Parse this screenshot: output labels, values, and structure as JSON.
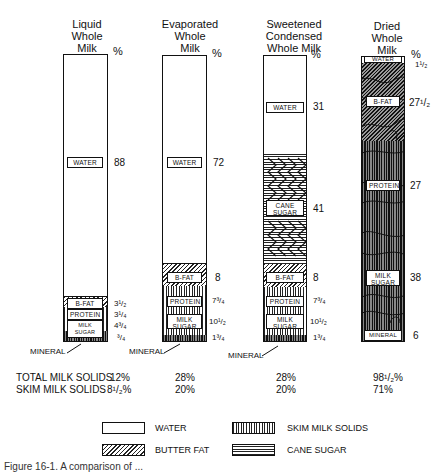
{
  "columns": [
    {
      "title": [
        "Liquid",
        "Whole",
        "Milk"
      ],
      "percent_header": "%",
      "segments": [
        {
          "component": "WATER",
          "label": "WATER",
          "value": "88",
          "pattern": "water"
        },
        {
          "component": "B-FAT",
          "label": "B-FAT",
          "value": "3¹/₂",
          "pattern": "butter-fat"
        },
        {
          "component": "PROTEIN",
          "label": "PROTEIN",
          "value": "3¹/₄",
          "pattern": "skim-milk-solids"
        },
        {
          "component": "MILK SUGAR",
          "label": "MILK SUGAR",
          "value": "4³/₄",
          "pattern": "skim-milk-solids"
        },
        {
          "component": "MINERAL",
          "label": "",
          "value": "³/₄",
          "pattern": "skim-milk-solids"
        }
      ],
      "mineral_pointer": "MINERAL",
      "total_milk_solids": "12%",
      "skim_milk_solids": "8¹/₂%"
    },
    {
      "title": [
        "Evaporated",
        "Whole",
        "Milk"
      ],
      "percent_header": "%",
      "segments": [
        {
          "component": "WATER",
          "label": "WATER",
          "value": "72",
          "pattern": "water"
        },
        {
          "component": "B-FAT",
          "label": "B-FAT",
          "value": "8",
          "pattern": "butter-fat"
        },
        {
          "component": "PROTEIN",
          "label": "PROTEIN",
          "value": "7³/₄",
          "pattern": "skim-milk-solids"
        },
        {
          "component": "MILK SUGAR",
          "label": "MILK SUGAR",
          "value": "10¹/₂",
          "pattern": "skim-milk-solids"
        },
        {
          "component": "MINERAL",
          "label": "",
          "value": "1³/₄",
          "pattern": "skim-milk-solids"
        }
      ],
      "mineral_pointer": "MINERAL",
      "total_milk_solids": "28%",
      "skim_milk_solids": "20%"
    },
    {
      "title": [
        "Sweetened",
        "Condensed",
        "Whole Milk"
      ],
      "percent_header": "%",
      "segments": [
        {
          "component": "WATER",
          "label": "WATER",
          "value": "31",
          "pattern": "water"
        },
        {
          "component": "CANE SUGAR",
          "label": "CANE SUGAR",
          "value": "41",
          "pattern": "cane-sugar"
        },
        {
          "component": "B-FAT",
          "label": "B-FAT",
          "value": "8",
          "pattern": "butter-fat"
        },
        {
          "component": "PROTEIN",
          "label": "PROTEIN",
          "value": "7³/₄",
          "pattern": "skim-milk-solids"
        },
        {
          "component": "MILK SUGAR",
          "label": "MILK SUGAR",
          "value": "10¹/₂",
          "pattern": "skim-milk-solids"
        },
        {
          "component": "MINERAL",
          "label": "",
          "value": "1³/₄",
          "pattern": "skim-milk-solids"
        }
      ],
      "mineral_pointer": "MINERAL",
      "total_milk_solids": "28%",
      "skim_milk_solids": "20%"
    },
    {
      "title": [
        "Dried",
        "Whole",
        "Milk"
      ],
      "percent_header": "%",
      "segments": [
        {
          "component": "WATER",
          "label": "WATER",
          "value": "1¹/₂",
          "pattern": "water"
        },
        {
          "component": "B-FAT",
          "label": "B-FAT",
          "value": "27¹/₂",
          "pattern": "butter-fat"
        },
        {
          "component": "PROTEIN",
          "label": "PROTEIN",
          "value": "27",
          "pattern": "skim-milk-solids"
        },
        {
          "component": "MILK SUGAR",
          "label": "MILK SUGAR",
          "value": "38",
          "pattern": "skim-milk-solids"
        },
        {
          "component": "MINERAL",
          "label": "MINERAL",
          "value": "6",
          "pattern": "skim-milk-solids"
        }
      ],
      "total_milk_solids": "98¹/₂%",
      "skim_milk_solids": "71%"
    }
  ],
  "summary_labels": {
    "total_milk_solids": "TOTAL MILK SOLIDS",
    "skim_milk_solids": "SKIM MILK SOLIDS"
  },
  "legend": [
    {
      "label": "WATER",
      "pattern": "water"
    },
    {
      "label": "SKIM MILK SOLIDS",
      "pattern": "skim-milk-solids"
    },
    {
      "label": "BUTTER FAT",
      "pattern": "butter-fat"
    },
    {
      "label": "CANE SUGAR",
      "pattern": "cane-sugar"
    }
  ],
  "caption": "Figure 16-1. A comparison of ..."
}
